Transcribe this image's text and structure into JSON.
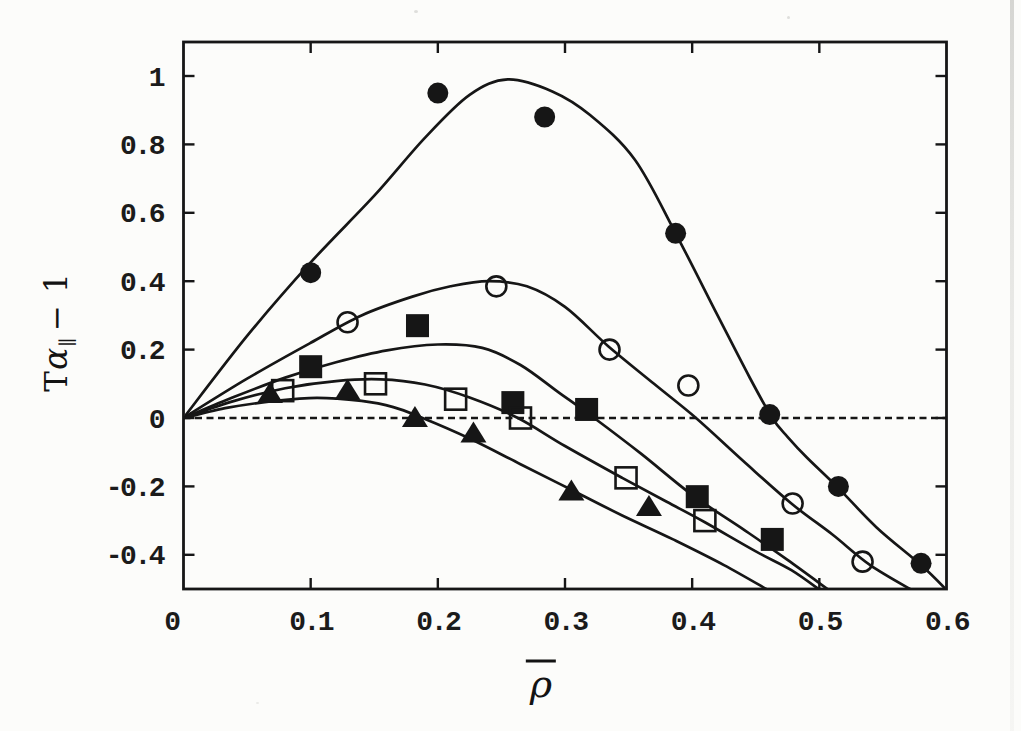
{
  "figure": {
    "background_color": "#fcfcfa",
    "ink_color": "#161616"
  },
  "chart_data": {
    "type": "scatter",
    "title": "",
    "xlabel": "ρ̄",
    "xlabel_parts": {
      "rho": "ρ",
      "overbar": true
    },
    "ylabel": "Tα∥ − 1",
    "ylabel_parts": {
      "t": "T",
      "alpha": "α",
      "sub": "∥",
      "rest": "− 1"
    },
    "xlim": [
      0,
      0.6
    ],
    "ylim": [
      -0.5,
      1.1
    ],
    "grid": false,
    "legend": null,
    "zero_line": {
      "y": 0,
      "style": "dashed"
    },
    "x_ticks": [
      {
        "value": 0,
        "label": "0"
      },
      {
        "value": 0.1,
        "label": "0.1"
      },
      {
        "value": 0.2,
        "label": "0.2"
      },
      {
        "value": 0.3,
        "label": "0.3"
      },
      {
        "value": 0.4,
        "label": "0.4"
      },
      {
        "value": 0.5,
        "label": "0.5"
      },
      {
        "value": 0.6,
        "label": "0.6"
      }
    ],
    "y_ticks": [
      {
        "value": 1,
        "label": "1"
      },
      {
        "value": 0.8,
        "label": "0.8"
      },
      {
        "value": 0.6,
        "label": "0.6"
      },
      {
        "value": 0.4,
        "label": "0.4"
      },
      {
        "value": 0.2,
        "label": "0.2"
      },
      {
        "value": 0,
        "label": "0"
      },
      {
        "value": -0.2,
        "label": "-0.2"
      },
      {
        "value": -0.4,
        "label": "-0.4"
      }
    ],
    "series": [
      {
        "name": "filled-circle",
        "marker": "circle",
        "fill": "filled",
        "points": [
          [
            0.1,
            0.425
          ],
          [
            0.2,
            0.95
          ],
          [
            0.284,
            0.88
          ],
          [
            0.387,
            0.54
          ],
          [
            0.461,
            0.01
          ],
          [
            0.515,
            -0.2
          ],
          [
            0.58,
            -0.425
          ]
        ],
        "curve": [
          [
            0,
            0
          ],
          [
            0.05,
            0.24
          ],
          [
            0.1,
            0.455
          ],
          [
            0.15,
            0.65
          ],
          [
            0.19,
            0.82
          ],
          [
            0.225,
            0.945
          ],
          [
            0.255,
            0.99
          ],
          [
            0.29,
            0.955
          ],
          [
            0.32,
            0.885
          ],
          [
            0.355,
            0.755
          ],
          [
            0.387,
            0.54
          ],
          [
            0.42,
            0.3
          ],
          [
            0.445,
            0.12
          ],
          [
            0.463,
            0.0
          ],
          [
            0.475,
            -0.055
          ],
          [
            0.49,
            -0.115
          ],
          [
            0.515,
            -0.205
          ],
          [
            0.545,
            -0.32
          ],
          [
            0.58,
            -0.43
          ],
          [
            0.602,
            -0.51
          ]
        ]
      },
      {
        "name": "open-circle",
        "marker": "circle",
        "fill": "open",
        "points": [
          [
            0.129,
            0.28
          ],
          [
            0.246,
            0.385
          ],
          [
            0.335,
            0.2
          ],
          [
            0.397,
            0.095
          ],
          [
            0.479,
            -0.25
          ],
          [
            0.534,
            -0.42
          ]
        ],
        "curve": [
          [
            0,
            0
          ],
          [
            0.05,
            0.115
          ],
          [
            0.1,
            0.22
          ],
          [
            0.14,
            0.3
          ],
          [
            0.18,
            0.355
          ],
          [
            0.21,
            0.385
          ],
          [
            0.24,
            0.4
          ],
          [
            0.27,
            0.385
          ],
          [
            0.3,
            0.325
          ],
          [
            0.334,
            0.21
          ],
          [
            0.37,
            0.1
          ],
          [
            0.403,
            0.0
          ],
          [
            0.44,
            -0.125
          ],
          [
            0.478,
            -0.25
          ],
          [
            0.51,
            -0.34
          ],
          [
            0.54,
            -0.43
          ],
          [
            0.576,
            -0.51
          ]
        ]
      },
      {
        "name": "filled-square",
        "marker": "square",
        "fill": "filled",
        "points": [
          [
            0.1,
            0.15
          ],
          [
            0.184,
            0.27
          ],
          [
            0.259,
            0.045
          ],
          [
            0.317,
            0.025
          ],
          [
            0.404,
            -0.23
          ],
          [
            0.463,
            -0.355
          ]
        ],
        "curve": [
          [
            0,
            0
          ],
          [
            0.04,
            0.062
          ],
          [
            0.08,
            0.118
          ],
          [
            0.12,
            0.163
          ],
          [
            0.16,
            0.198
          ],
          [
            0.2,
            0.215
          ],
          [
            0.235,
            0.205
          ],
          [
            0.265,
            0.155
          ],
          [
            0.295,
            0.075
          ],
          [
            0.323,
            0.0
          ],
          [
            0.36,
            -0.105
          ],
          [
            0.4,
            -0.225
          ],
          [
            0.44,
            -0.325
          ],
          [
            0.475,
            -0.415
          ],
          [
            0.51,
            -0.51
          ]
        ]
      },
      {
        "name": "open-square",
        "marker": "square",
        "fill": "open",
        "points": [
          [
            0.078,
            0.08
          ],
          [
            0.151,
            0.1
          ],
          [
            0.214,
            0.055
          ],
          [
            0.265,
            0.0
          ],
          [
            0.348,
            -0.175
          ],
          [
            0.41,
            -0.3
          ]
        ],
        "curve": [
          [
            0,
            0
          ],
          [
            0.04,
            0.05
          ],
          [
            0.08,
            0.087
          ],
          [
            0.12,
            0.108
          ],
          [
            0.155,
            0.113
          ],
          [
            0.19,
            0.098
          ],
          [
            0.225,
            0.06
          ],
          [
            0.263,
            0.0
          ],
          [
            0.3,
            -0.082
          ],
          [
            0.345,
            -0.175
          ],
          [
            0.38,
            -0.245
          ],
          [
            0.41,
            -0.305
          ],
          [
            0.45,
            -0.39
          ],
          [
            0.478,
            -0.445
          ],
          [
            0.503,
            -0.51
          ]
        ]
      },
      {
        "name": "filled-triangle",
        "marker": "triangle",
        "fill": "filled",
        "points": [
          [
            0.068,
            0.07
          ],
          [
            0.129,
            0.08
          ],
          [
            0.182,
            0.0
          ],
          [
            0.228,
            -0.045
          ],
          [
            0.305,
            -0.215
          ],
          [
            0.366,
            -0.26
          ]
        ],
        "curve": [
          [
            0,
            0
          ],
          [
            0.035,
            0.03
          ],
          [
            0.07,
            0.049
          ],
          [
            0.105,
            0.059
          ],
          [
            0.14,
            0.05
          ],
          [
            0.165,
            0.032
          ],
          [
            0.188,
            0.0
          ],
          [
            0.225,
            -0.06
          ],
          [
            0.265,
            -0.135
          ],
          [
            0.305,
            -0.21
          ],
          [
            0.345,
            -0.285
          ],
          [
            0.385,
            -0.355
          ],
          [
            0.425,
            -0.43
          ],
          [
            0.463,
            -0.51
          ]
        ]
      }
    ]
  }
}
